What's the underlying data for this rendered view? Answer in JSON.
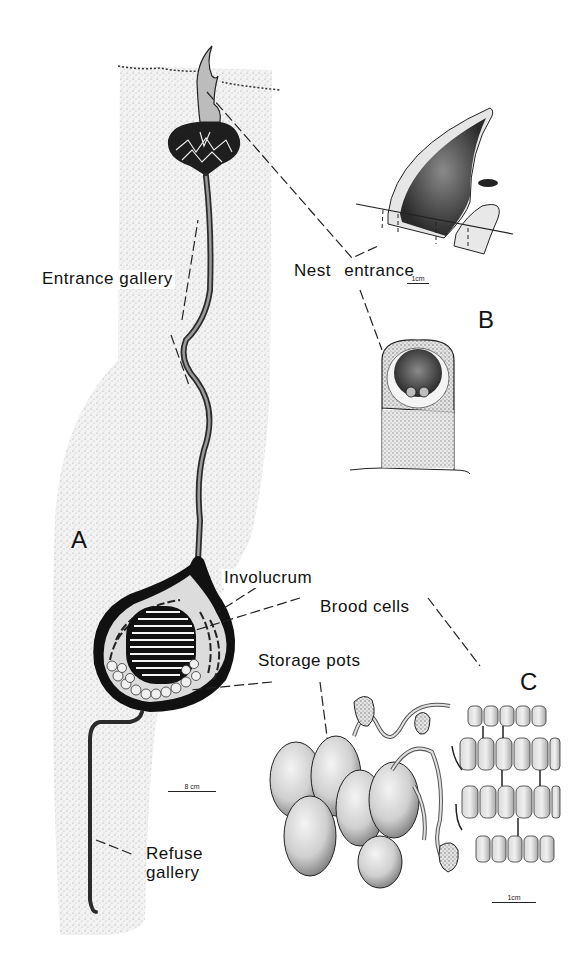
{
  "figure": {
    "panels": [
      {
        "id": "A",
        "letter": "A",
        "description": "Vertical section of underground nest in soil"
      },
      {
        "id": "B",
        "letter": "B",
        "description": "Nest entrance, side and front view"
      },
      {
        "id": "C",
        "letter": "C",
        "description": "Storage pots and brood cells"
      }
    ],
    "labels": {
      "entrance_gallery": "Entrance gallery",
      "nest_entrance": "Nest entrance",
      "involucrum": "Involucrum",
      "brood_cells": "Brood cells",
      "storage_pots": "Storage pots",
      "refuse_gallery_line1": "Refuse",
      "refuse_gallery_line2": "gallery"
    },
    "scale_bars": {
      "panel_a": "8 cm",
      "panel_b": "1cm",
      "panel_c": "1cm"
    },
    "colors": {
      "ink": "#111111",
      "soil_stipple": "#cfcfcf",
      "background": "#ffffff"
    }
  }
}
